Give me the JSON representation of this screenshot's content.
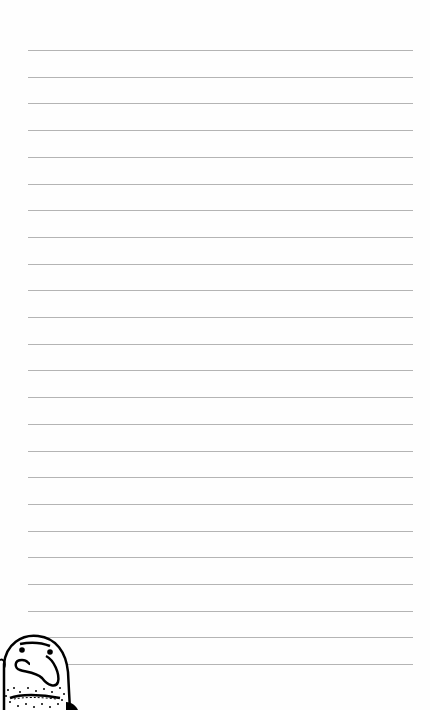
{
  "page": {
    "type": "lined-notebook-page",
    "background_color": "#ffffff",
    "rule_color": "#b4b4b4",
    "rule_count": 24,
    "rule_start_y": 50,
    "rule_spacing": 26.7,
    "rule_left": 28,
    "rule_width": 385
  },
  "illustration": {
    "name": "cartoon-face-doodle",
    "position": "bottom-left",
    "features": [
      "bald head",
      "dot eyes",
      "furrowed brow",
      "large curved nose",
      "stubble dots",
      "wavy mouth"
    ]
  }
}
